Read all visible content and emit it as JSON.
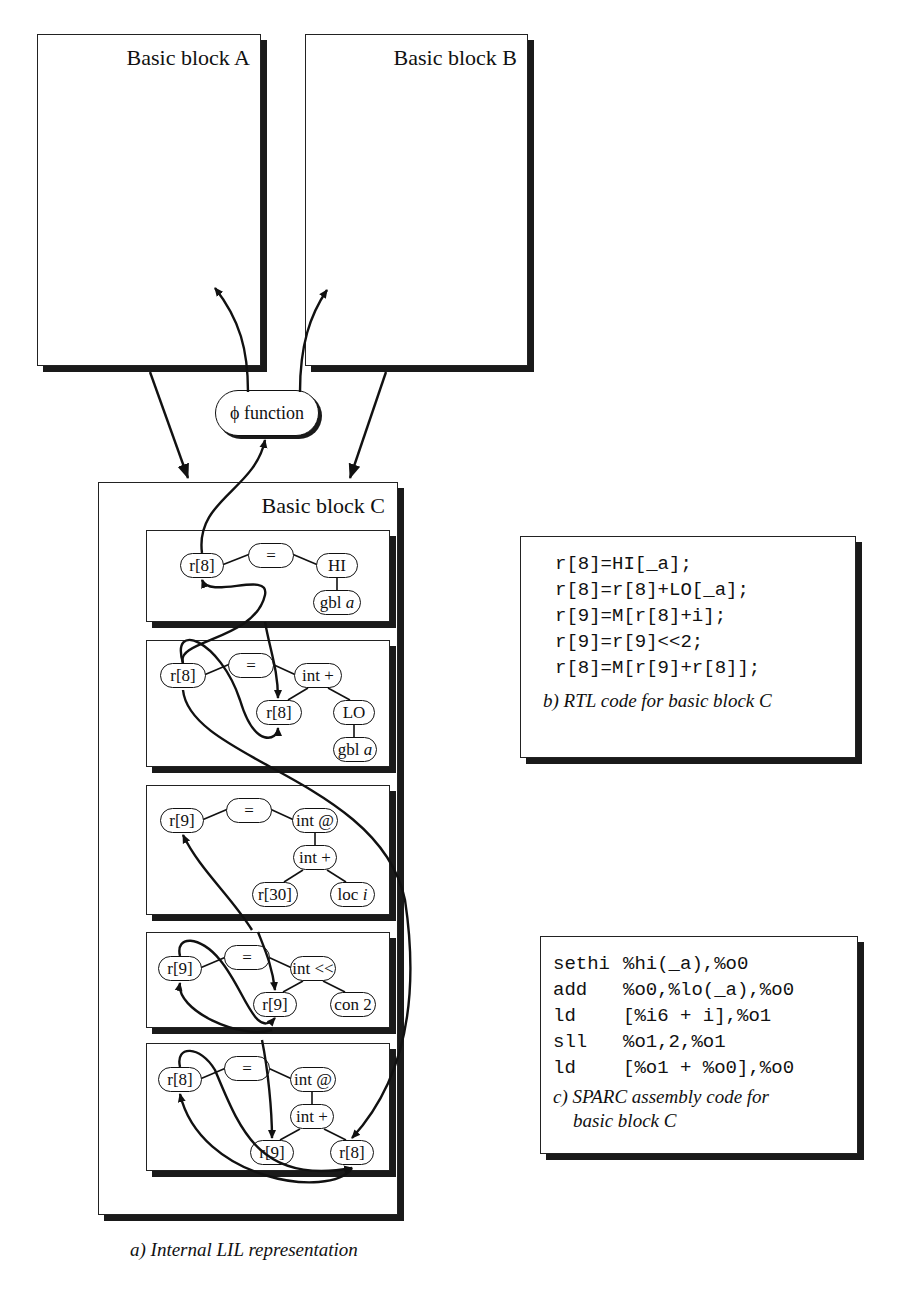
{
  "blocks": {
    "a": {
      "title": "Basic block A"
    },
    "b": {
      "title": "Basic block B"
    },
    "c": {
      "title": "Basic block C"
    }
  },
  "phi": {
    "symbol": "ϕ",
    "label": "function"
  },
  "statements": [
    {
      "nodes": {
        "dest": "r[8]",
        "op": "=",
        "rhs": "HI",
        "leaf": "gbl",
        "leaf_var": "a"
      }
    },
    {
      "nodes": {
        "dest": "r[8]",
        "op": "=",
        "rhs": "int +",
        "left": "r[8]",
        "right": "LO",
        "leaf": "gbl",
        "leaf_var": "a"
      }
    },
    {
      "nodes": {
        "dest": "r[9]",
        "op": "=",
        "rhs": "int @",
        "mid": "int +",
        "left": "r[30]",
        "right": "loc",
        "right_var": "i"
      }
    },
    {
      "nodes": {
        "dest": "r[9]",
        "op": "=",
        "rhs": "int <<",
        "left": "r[9]",
        "right": "con 2"
      }
    },
    {
      "nodes": {
        "dest": "r[8]",
        "op": "=",
        "rhs": "int @",
        "mid": "int +",
        "left": "r[9]",
        "right": "r[8]"
      }
    }
  ],
  "rtl": {
    "lines": [
      "r[8]=HI[_a];",
      "r[8]=r[8]+LO[_a];",
      "r[9]=M[r[8]+i];",
      "r[9]=r[9]<<2;",
      "r[8]=M[r[9]+r[8]];"
    ],
    "caption": "b) RTL code for basic block C"
  },
  "sparc": {
    "lines": [
      {
        "op": "sethi",
        "args": "%hi(_a),%o0"
      },
      {
        "op": "add",
        "args": "%o0,%lo(_a),%o0"
      },
      {
        "op": "ld",
        "args": "[%i6 + i],%o1"
      },
      {
        "op": "sll",
        "args": "%o1,2,%o1"
      },
      {
        "op": "ld",
        "args": "[%o1 + %o0],%o0"
      }
    ],
    "caption_line1": "c) SPARC assembly code for",
    "caption_line2": "basic block C"
  },
  "figure_caption": "a) Internal LIL representation"
}
